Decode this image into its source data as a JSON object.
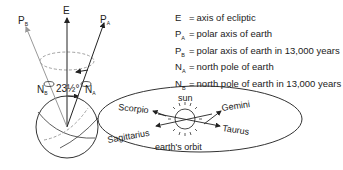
{
  "diagram": {
    "labels": {
      "axis_E": "E",
      "axis_PA_main": "P",
      "axis_PA_sub": "A",
      "axis_PB_main": "P",
      "axis_PB_sub": "B",
      "pole_NA_main": "N",
      "pole_NA_sub": "A",
      "pole_NB_main": "N",
      "pole_NB_sub": "B",
      "angle": "23½°",
      "sun": "sun",
      "orbit": "earth's orbit",
      "constellations": [
        "Scorpio",
        "Sagittarius",
        "Gemini",
        "Taurus"
      ]
    },
    "legend": [
      {
        "sym_main": "E",
        "sym_sub": "",
        "eq": "=",
        "text": "axis of ecliptic"
      },
      {
        "sym_main": "P",
        "sym_sub": "A",
        "eq": "=",
        "text": "polar axis of earth"
      },
      {
        "sym_main": "P",
        "sym_sub": "B",
        "eq": "=",
        "text": "polar axis of earth in 13,000 years"
      },
      {
        "sym_main": "N",
        "sym_sub": "A",
        "eq": "=",
        "text": "north pole of earth"
      },
      {
        "sym_main": "N",
        "sym_sub": "B",
        "eq": "=",
        "text": "north pole of earth in 13,000 years"
      }
    ],
    "colors": {
      "line": "#333333",
      "gray_arrow": "#999999",
      "dashed": "#888888"
    }
  }
}
